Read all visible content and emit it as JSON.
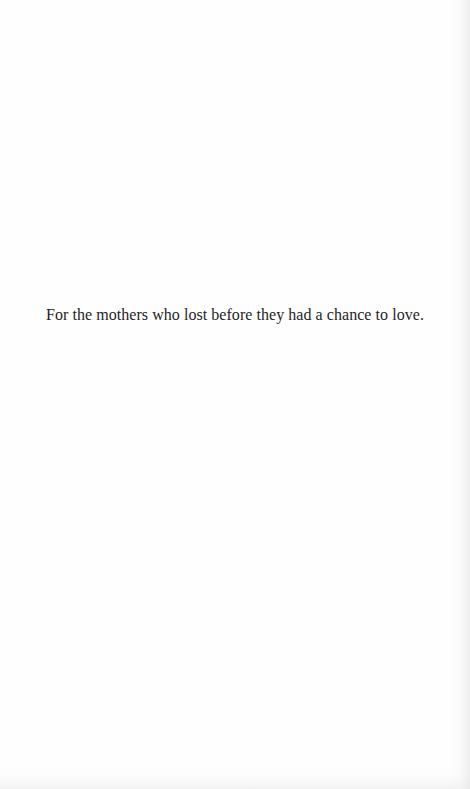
{
  "page": {
    "dedication": "For the mothers who lost before they had a chance to love."
  }
}
